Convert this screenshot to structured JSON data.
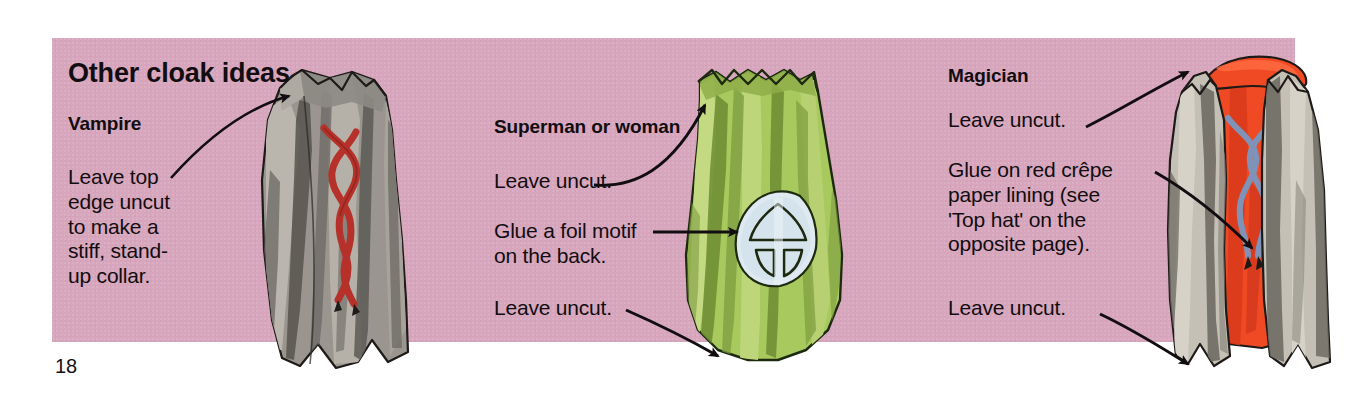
{
  "page": {
    "number": "18",
    "background_color": "#ffffff",
    "panel_color": "#d7a6bc"
  },
  "heading": {
    "main": "Other cloak ideas"
  },
  "sections": [
    {
      "id": "vampire",
      "title": "Vampire",
      "notes": [
        "Leave top\nedge uncut\nto make a\nstiff, stand-\nup collar."
      ],
      "illustration": {
        "name": "vampire-cloak",
        "fabric_color": "#8d8a84",
        "highlight_color": "#b9b6ae",
        "shadow_color": "#5f5d58",
        "tie_color": "#b5312a"
      }
    },
    {
      "id": "superman",
      "title": "Superman or woman",
      "notes": [
        "Leave uncut.",
        "Glue a foil motif\non the back.",
        "Leave uncut."
      ],
      "illustration": {
        "name": "superman-cloak",
        "fabric_color": "#9cbf52",
        "highlight_color": "#bcd77a",
        "shadow_color": "#7e9f3c",
        "motif_color": "#d7e4ee"
      }
    },
    {
      "id": "magician",
      "title": "Magician",
      "notes": [
        "Leave uncut.",
        "Glue on red crêpe\npaper lining (see\n'Top hat' on the\nopposite page).",
        "Leave uncut."
      ],
      "illustration": {
        "name": "magician-cloak",
        "fabric_color": "#b6b2a8",
        "shadow_color": "#6e6b63",
        "lining_color": "#ef4a23",
        "lining_shadow": "#c9351a",
        "tie_color": "#7f93b8"
      }
    }
  ],
  "arrows": [
    {
      "name": "arrow-vampire-collar",
      "points_to": "vampire-cloak-collar"
    },
    {
      "name": "arrow-superman-top",
      "points_to": "superman-cloak-top-edge"
    },
    {
      "name": "arrow-superman-motif",
      "points_to": "superman-cloak-foil-motif"
    },
    {
      "name": "arrow-superman-hem",
      "points_to": "superman-cloak-hem"
    },
    {
      "name": "arrow-magician-top",
      "points_to": "magician-cloak-top-edge"
    },
    {
      "name": "arrow-magician-lining",
      "points_to": "magician-cloak-lining"
    },
    {
      "name": "arrow-magician-hem",
      "points_to": "magician-cloak-hem"
    }
  ]
}
